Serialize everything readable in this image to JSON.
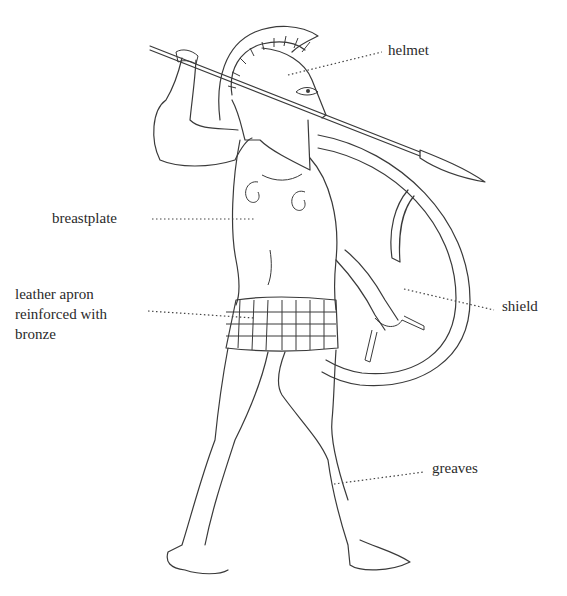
{
  "figure": {
    "labels": {
      "helmet": "helmet",
      "breastplate": "breastplate",
      "apron_line1": "leather apron",
      "apron_line2": "reinforced with",
      "apron_line3": "bronze",
      "shield": "shield",
      "greaves": "greaves"
    },
    "colors": {
      "ink": "#3a3a3a",
      "background": "#ffffff"
    }
  }
}
